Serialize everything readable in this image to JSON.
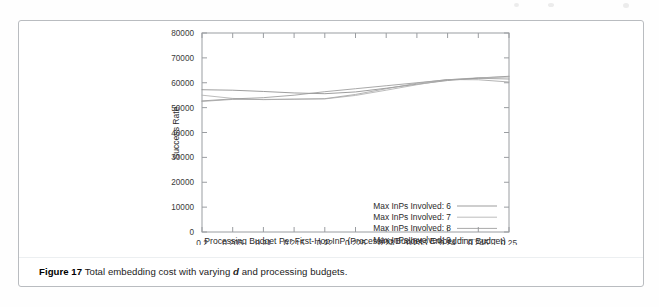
{
  "figure": {
    "caption_number": "Figure 17",
    "caption_text": "Total embedding cost with varying",
    "caption_variable": "d",
    "caption_text_tail": "and processing budgets."
  },
  "chart_data": {
    "type": "line",
    "title": "",
    "xlabel": "Processing Budget Per First-Hop InP (Processing Budget : Embedding Budget)",
    "ylabel": "Success Rate",
    "xlim": [
      0.2,
      0.25
    ],
    "ylim": [
      0,
      80000
    ],
    "xticks": [
      0.2,
      0.205,
      0.21,
      0.215,
      0.22,
      0.225,
      0.23,
      0.235,
      0.24,
      0.245,
      0.25
    ],
    "xticklabels": [
      "0.2",
      "0.205",
      "0.21",
      "0.215",
      "0.22",
      "0.225",
      "0.23",
      "0.235",
      "0.24",
      "0.245",
      "0.25"
    ],
    "yticks": [
      0,
      10000,
      20000,
      30000,
      40000,
      50000,
      60000,
      70000,
      80000
    ],
    "yticklabels": [
      "0",
      "10000",
      "20000",
      "30000",
      "40000",
      "50000",
      "60000",
      "70000",
      "80000"
    ],
    "grid": false,
    "legend_position": "lower-right",
    "x": [
      0.2,
      0.205,
      0.21,
      0.215,
      0.22,
      0.225,
      0.23,
      0.235,
      0.24,
      0.245,
      0.25
    ],
    "series": [
      {
        "name": "Max InPs Involved: 6",
        "color": "#8c8c8c",
        "values": [
          57200,
          57000,
          56500,
          55900,
          55600,
          56300,
          57800,
          59400,
          60900,
          61900,
          62600
        ]
      },
      {
        "name": "Max InPs Involved: 7",
        "color": "#b0b0b0",
        "values": [
          55000,
          53700,
          53200,
          53400,
          53500,
          54900,
          57000,
          59200,
          61200,
          62000,
          62300
        ]
      },
      {
        "name": "Max InPs Involved: 8",
        "color": "#9a9a9a",
        "values": [
          52700,
          53500,
          54000,
          55000,
          56400,
          57600,
          58800,
          60000,
          61200,
          61800,
          61500
        ]
      },
      {
        "name": "Max InPs Involved: 9",
        "color": "#a5a5a5",
        "values": [
          52500,
          53300,
          53300,
          53400,
          53600,
          55300,
          57600,
          59800,
          61300,
          61200,
          60300
        ]
      }
    ]
  },
  "legend": {
    "items": [
      {
        "label": "Max InPs Involved: 6"
      },
      {
        "label": "Max InPs Involved: 7"
      },
      {
        "label": "Max InPs Involved: 8"
      },
      {
        "label": "Max InPs Involved: 9"
      }
    ]
  }
}
